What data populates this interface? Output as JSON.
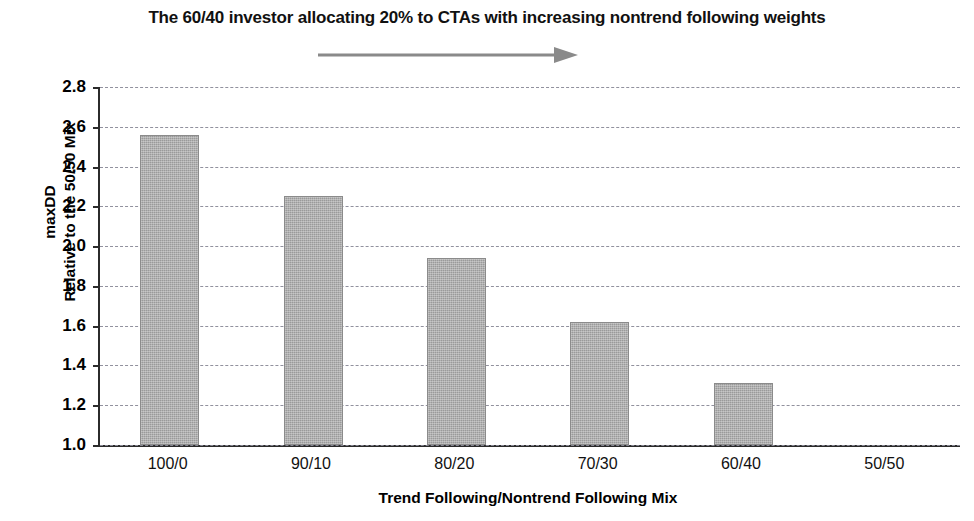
{
  "chart_data": {
    "type": "bar",
    "title": "The 60/40 investor allocating 20% to CTAs with increasing nontrend following weights",
    "subtitle_arrow": "rightward-arrow",
    "categories": [
      "100/0",
      "90/10",
      "80/20",
      "70/30",
      "60/40",
      "50/50"
    ],
    "values": [
      2.56,
      2.25,
      1.94,
      1.62,
      1.31,
      1.0
    ],
    "xlabel": "Trend Following/Nontrend Following Mix",
    "ylabel_line1": "maxDD",
    "ylabel_line2": "Relative to the 50/50 Mix",
    "ylim": [
      1.0,
      2.8
    ],
    "ytick_labels": [
      "2.8",
      "2.6",
      "2.4",
      "2.2",
      "2.0",
      "1.8",
      "1.6",
      "1.4",
      "1.2",
      "1.0"
    ],
    "ytick_values": [
      2.8,
      2.6,
      2.4,
      2.2,
      2.0,
      1.8,
      1.6,
      1.4,
      1.2,
      1.0
    ],
    "grid": true,
    "grid_style": "dashed",
    "legend": null,
    "bar_color": "#9a9a9a",
    "axis_color": "#2b2b2b",
    "grid_color": "#8c8c99"
  }
}
